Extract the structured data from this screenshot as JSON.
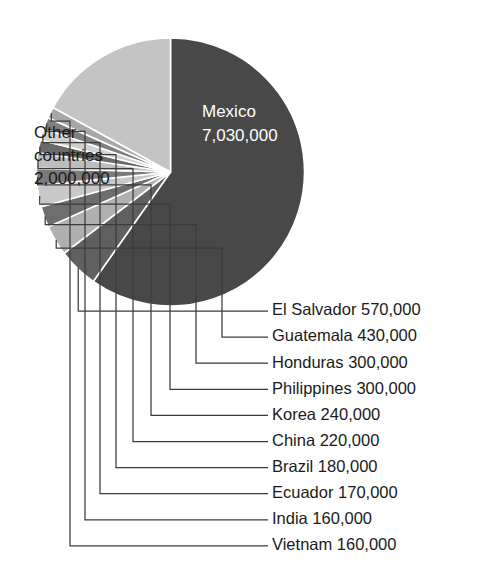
{
  "chart_data": {
    "type": "pie",
    "title": "",
    "subtitle": "",
    "xlabel": "",
    "ylabel": "",
    "legend_position": "none",
    "grid": false,
    "units": "people",
    "total": 11760000,
    "categories": [
      "Mexico",
      "Other countries",
      "El Salvador",
      "Guatemala",
      "Honduras",
      "Philippines",
      "Korea",
      "China",
      "Brazil",
      "Ecuador",
      "India",
      "Vietnam"
    ],
    "values": [
      7030000,
      2000000,
      570000,
      430000,
      300000,
      300000,
      240000,
      220000,
      180000,
      170000,
      160000,
      160000
    ],
    "value_labels": [
      "7,030,000",
      "2,000,000",
      "570,000",
      "430,000",
      "300,000",
      "300,000",
      "240,000",
      "220,000",
      "180,000",
      "170,000",
      "160,000",
      "160,000"
    ],
    "slice_colors": [
      "#484848",
      "#c4c4c4",
      "#606060",
      "#b0b0b0",
      "#6e6e6e",
      "#c8c8c8",
      "#7a7a7a",
      "#bdbdbd",
      "#6a6a6a",
      "#d0d0d0",
      "#808080",
      "#a8a8a8"
    ]
  },
  "inside_labels": {
    "mexico": {
      "name": "Mexico",
      "value": "7,030,000"
    },
    "other": {
      "line1": "Other",
      "line2": "countries",
      "value": "2,000,000"
    }
  },
  "callouts": [
    {
      "label": "El Salvador 570,000"
    },
    {
      "label": "Guatemala 430,000"
    },
    {
      "label": "Honduras 300,000"
    },
    {
      "label": "Philippines 300,000"
    },
    {
      "label": "Korea 240,000"
    },
    {
      "label": "China 220,000"
    },
    {
      "label": "Brazil 180,000"
    },
    {
      "label": "Ecuador 170,000"
    },
    {
      "label": "India 160,000"
    },
    {
      "label": "Vietnam 160,000"
    }
  ],
  "colors": {
    "background": "#ffffff",
    "text_dark": "#1a1a1a",
    "text_light": "#ffffff",
    "leader_line": "#3b3b3b",
    "slice_dark": "#484848",
    "slice_light": "#c4c4c4"
  }
}
